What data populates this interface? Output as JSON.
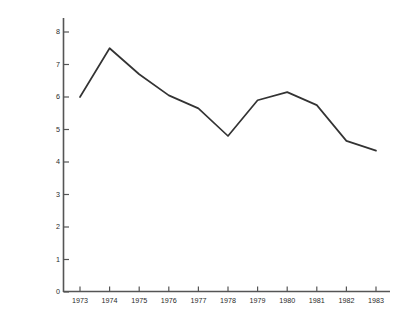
{
  "chart_data": {
    "type": "line",
    "title": "",
    "subtitle": "",
    "xlabel": "",
    "ylabel": "Average Fuel Cost of New Vehicles (1982 cents per mile)",
    "categories": [
      "1973",
      "1974",
      "1975",
      "1976",
      "1977",
      "1978",
      "1979",
      "1980",
      "1981",
      "1982",
      "1983"
    ],
    "x": [
      1973,
      1974,
      1975,
      1976,
      1977,
      1978,
      1979,
      1980,
      1981,
      1982,
      1983
    ],
    "values": [
      6.0,
      7.5,
      6.7,
      6.05,
      5.65,
      4.8,
      5.9,
      6.15,
      5.75,
      4.65,
      4.35
    ],
    "series": [
      {
        "name": "Average Fuel Cost of New Vehicles",
        "values": [
          6.0,
          7.5,
          6.7,
          6.05,
          5.65,
          4.8,
          5.9,
          6.15,
          5.75,
          4.65,
          4.35
        ]
      }
    ],
    "ylim": [
      0,
      8
    ],
    "xlim": [
      1973,
      1983
    ],
    "yticks": [
      0,
      1,
      2,
      3,
      4,
      5,
      6,
      7,
      8
    ],
    "ytick_labels": [
      "0",
      "1",
      "2",
      "3",
      "4",
      "5",
      "6",
      "7",
      "8"
    ],
    "xtick_labels": [
      "1973",
      "1974",
      "1975",
      "1976",
      "1977",
      "1978",
      "1979",
      "1980",
      "1981",
      "1982",
      "1983"
    ],
    "grid": false,
    "legend": false,
    "legend_position": "none",
    "line_color": "#333333",
    "axis_color": "#555555",
    "background_color": "#ffffff",
    "annotations": []
  }
}
